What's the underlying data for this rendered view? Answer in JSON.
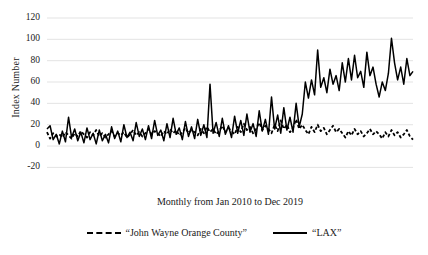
{
  "chart_data": {
    "type": "line",
    "title": "",
    "xlabel": "Monthly from Jan 2010 to Dec 2019",
    "ylabel": "Index Number",
    "ylim": [
      -20,
      120
    ],
    "yticks": [
      -20,
      0,
      20,
      40,
      60,
      80,
      100,
      120
    ],
    "ytick_labels": [
      "-20",
      "0",
      "20",
      "40",
      "60",
      "80",
      "100",
      "120"
    ],
    "grid": true,
    "legend_position": "bottom",
    "x_description": "Monthly from Jan 2010 to Dec 2019",
    "x_count": 120,
    "series": [
      {
        "name": "“John Wayne Orange County”",
        "style": "dashed",
        "color": "#000000",
        "values": [
          13,
          7,
          12,
          9,
          11,
          8,
          13,
          10,
          7,
          12,
          9,
          14,
          11,
          8,
          13,
          10,
          15,
          9,
          12,
          8,
          11,
          14,
          9,
          12,
          10,
          13,
          8,
          11,
          15,
          10,
          13,
          9,
          12,
          16,
          11,
          14,
          12,
          9,
          14,
          11,
          16,
          12,
          15,
          10,
          13,
          17,
          12,
          15,
          13,
          10,
          16,
          12,
          18,
          13,
          16,
          11,
          14,
          19,
          13,
          17,
          14,
          11,
          18,
          13,
          21,
          15,
          18,
          12,
          16,
          22,
          15,
          19,
          16,
          12,
          20,
          14,
          24,
          16,
          20,
          13,
          17,
          25,
          16,
          20,
          15,
          11,
          18,
          13,
          20,
          14,
          17,
          11,
          15,
          19,
          13,
          16,
          12,
          8,
          14,
          10,
          16,
          11,
          14,
          9,
          12,
          16,
          11,
          14,
          11,
          7,
          13,
          9,
          15,
          10,
          13,
          8,
          11,
          15,
          9,
          6
        ]
      },
      {
        "name": "“LAX”",
        "style": "solid",
        "color": "#000000",
        "values": [
          16,
          19,
          6,
          11,
          2,
          14,
          4,
          27,
          8,
          16,
          5,
          13,
          3,
          17,
          6,
          12,
          2,
          15,
          5,
          11,
          3,
          18,
          7,
          14,
          4,
          20,
          8,
          13,
          5,
          22,
          9,
          16,
          6,
          19,
          7,
          24,
          10,
          15,
          5,
          21,
          8,
          26,
          11,
          17,
          6,
          23,
          9,
          18,
          7,
          25,
          10,
          20,
          8,
          58,
          12,
          22,
          9,
          26,
          11,
          19,
          8,
          28,
          12,
          24,
          10,
          30,
          13,
          21,
          9,
          33,
          14,
          25,
          11,
          46,
          16,
          29,
          12,
          36,
          15,
          27,
          13,
          40,
          18,
          30,
          60,
          45,
          62,
          48,
          90,
          55,
          64,
          50,
          72,
          58,
          66,
          52,
          78,
          60,
          82,
          62,
          85,
          64,
          70,
          55,
          88,
          66,
          74,
          58,
          46,
          60,
          52,
          68,
          101,
          78,
          62,
          74,
          58,
          82,
          66,
          70
        ]
      }
    ]
  },
  "legend": [
    {
      "label": "“John Wayne Orange County”",
      "style": "dashed"
    },
    {
      "label": "“LAX”",
      "style": "solid"
    }
  ]
}
